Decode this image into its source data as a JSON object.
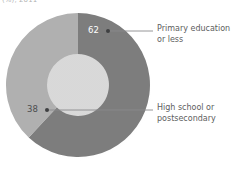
{
  "caption": {
    "clipped_fragment": "(%), 2011"
  },
  "chart_data": {
    "type": "pie",
    "variant": "donut",
    "title": "",
    "subtitle": "",
    "xlabel": "",
    "ylabel": "",
    "grid": false,
    "legend_position": "callout-right",
    "units": "percent",
    "start_angle_deg": 0,
    "direction": "clockwise",
    "inner_radius_ratio": 0.43,
    "categories": [
      "Primary education or less",
      "High school or postsecondary"
    ],
    "values": [
      62,
      38
    ],
    "slices": [
      {
        "label": "Primary education or less",
        "value": 62,
        "value_text": "62",
        "color": "#7d7d7d",
        "start_deg": 0,
        "end_deg": 223.2,
        "label_color": "#ffffff",
        "callout_lines": [
          "Primary education",
          "or less"
        ]
      },
      {
        "label": "High school or postsecondary",
        "value": 38,
        "value_text": "38",
        "color": "#b0b0b0",
        "start_deg": 223.2,
        "end_deg": 360,
        "label_color": "#4c4d4f",
        "callout_lines": [
          "High school or",
          "postsecondary"
        ]
      }
    ]
  },
  "colors": {
    "slice_dark": "#7d7d7d",
    "slice_light": "#b0b0b0",
    "leader_line": "#8a8b8d",
    "marker_dot": "#3f4042",
    "callout_text": "#5d5e60",
    "background": "#ffffff"
  },
  "callouts": {
    "primary": {
      "line1": "Primary education",
      "line2": "or less"
    },
    "highschool": {
      "line1": "High school or",
      "line2": "postsecondary"
    }
  }
}
